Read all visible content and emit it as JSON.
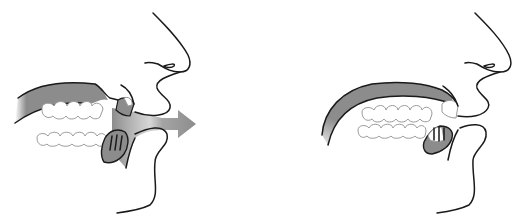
{
  "figure": {
    "panels": [
      {
        "id": "left",
        "label": "",
        "features": [
          "nose",
          "upper-lip",
          "lower-lip",
          "chin",
          "palate",
          "upper-teeth",
          "lower-teeth",
          "tongue",
          "airflow-arrow"
        ],
        "airflow": true
      },
      {
        "id": "right",
        "label": "",
        "features": [
          "nose",
          "upper-lip",
          "lower-lip",
          "chin",
          "palate",
          "upper-teeth",
          "lower-teeth",
          "tongue"
        ],
        "airflow": false
      }
    ],
    "colors": {
      "outline": "#1a1a1a",
      "fill_gray": "#8c8c8c",
      "tooth_outline": "#9a9a9a",
      "background": "#ffffff"
    }
  }
}
